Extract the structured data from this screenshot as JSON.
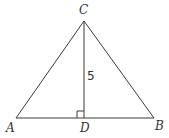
{
  "diagram": {
    "type": "triangle-with-altitude",
    "stroke_color": "#3a3a3a",
    "vertices": {
      "A": {
        "label": "A",
        "x": 16,
        "y": 118
      },
      "B": {
        "label": "B",
        "x": 154,
        "y": 118
      },
      "C": {
        "label": "C",
        "x": 84,
        "y": 21
      },
      "D": {
        "label": "D",
        "x": 84,
        "y": 118
      }
    },
    "segments": [
      {
        "from": "A",
        "to": "B"
      },
      {
        "from": "A",
        "to": "C"
      },
      {
        "from": "C",
        "to": "B"
      },
      {
        "from": "C",
        "to": "D"
      }
    ],
    "measurements": {
      "CD": "5"
    },
    "right_angle_at": "D"
  }
}
